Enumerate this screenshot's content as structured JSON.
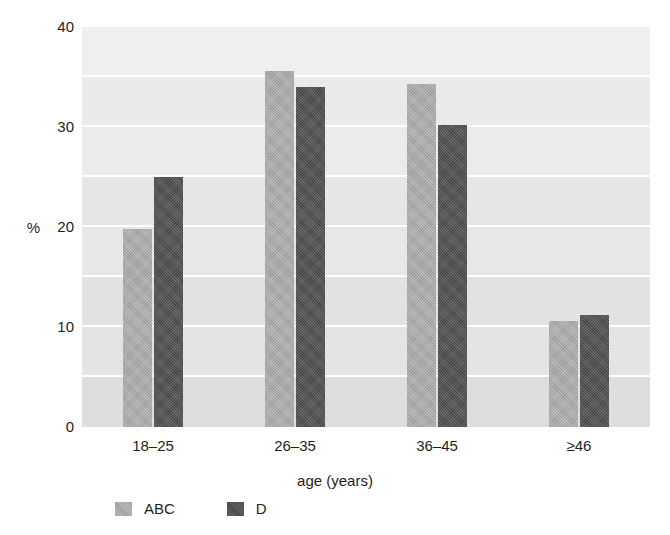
{
  "chart_data": {
    "type": "bar",
    "title": "",
    "subtitle": "",
    "xlabel": "age (years)",
    "ylabel": "%",
    "categories": [
      "18–25",
      "26–35",
      "36–45",
      "≥46"
    ],
    "series": [
      {
        "name": "ABC",
        "values": [
          19.8,
          35.6,
          34.3,
          10.6
        ],
        "color": "#a9a9a9"
      },
      {
        "name": "D",
        "values": [
          25.0,
          34.0,
          30.2,
          11.2
        ],
        "color": "#4f4f4f"
      }
    ],
    "ylim": [
      0,
      40
    ],
    "ytick_labels": [
      "0",
      "10",
      "20",
      "30",
      "40"
    ],
    "ytick_values": [
      0,
      10,
      20,
      30,
      40
    ],
    "gridlines": [
      5,
      10,
      15,
      20,
      25,
      30,
      35
    ],
    "grid": true,
    "grid_color": "#fdfdfd",
    "plot_background": "#e9e9e9",
    "legend_position": "bottom-left",
    "legend_entries": [
      "ABC",
      "D"
    ]
  },
  "axis": {
    "y_title": "%",
    "x_title": "age (years)"
  },
  "legend": {
    "items": [
      {
        "label": "ABC",
        "swatch": "legend-swatch-abc"
      },
      {
        "label": "D",
        "swatch": "legend-swatch-d"
      }
    ]
  }
}
